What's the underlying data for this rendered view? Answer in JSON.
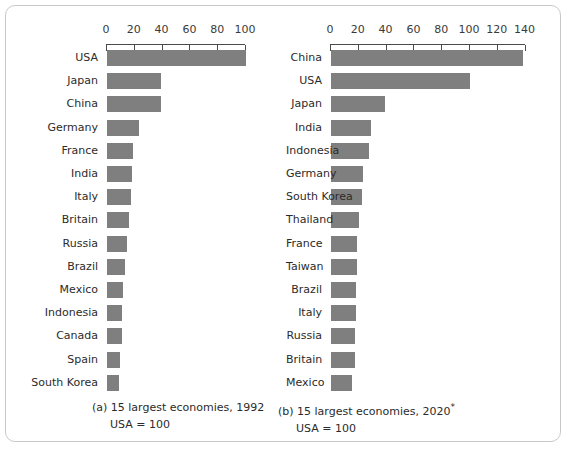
{
  "figure": {
    "background_color": "#ffffff",
    "bar_color": "#7f7f7f",
    "axis_color": "#4a4a4a",
    "frame_color": "#c9c9c9"
  },
  "panels": [
    {
      "id": "panel-a",
      "caption_line1": "(a) 15 largest economies, 1992",
      "caption_line2": "USA = 100"
    },
    {
      "id": "panel-b",
      "caption_line1": "(b) 15 largest economies, 2020",
      "caption_footnote": "*",
      "caption_line2": "USA = 100"
    }
  ],
  "chart_data": [
    {
      "type": "bar",
      "orientation": "horizontal",
      "title": "(a) 15 largest economies, 1992",
      "subtitle": "USA = 100",
      "xlabel": "",
      "ylabel": "",
      "xlim": [
        0,
        100
      ],
      "xticks": [
        0,
        20,
        40,
        60,
        80,
        100
      ],
      "axis_position": "top",
      "grid": false,
      "legend": "none",
      "categories": [
        "USA",
        "Japan",
        "China",
        "Germany",
        "France",
        "India",
        "Italy",
        "Britain",
        "Russia",
        "Brazil",
        "Mexico",
        "Indonesia",
        "Canada",
        "Spain",
        "South Korea"
      ],
      "values": [
        100,
        39,
        39,
        23,
        19,
        18,
        17,
        16,
        14.5,
        13,
        11.5,
        11,
        10.5,
        9,
        8.5
      ]
    },
    {
      "type": "bar",
      "orientation": "horizontal",
      "title": "(b) 15 largest economies, 2020*",
      "subtitle": "USA = 100",
      "xlabel": "",
      "ylabel": "",
      "xlim": [
        0,
        140
      ],
      "xticks": [
        0,
        20,
        40,
        60,
        80,
        100,
        120,
        140
      ],
      "axis_position": "top",
      "grid": false,
      "legend": "none",
      "categories": [
        "China",
        "USA",
        "Japan",
        "India",
        "Indonesia",
        "Germany",
        "South Korea",
        "Thailand",
        "France",
        "Taiwan",
        "Brazil",
        "Italy",
        "Russia",
        "Britain",
        "Mexico"
      ],
      "values": [
        138,
        100,
        39,
        29,
        27,
        23,
        22,
        20,
        19,
        19,
        18,
        18,
        17,
        17,
        15
      ]
    }
  ]
}
